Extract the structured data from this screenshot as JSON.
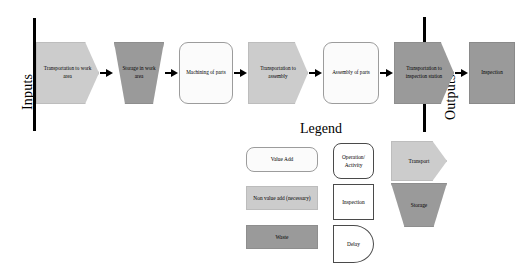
{
  "boundaries": {
    "input_label": "Inputs",
    "output_label": "Outputs"
  },
  "flow": {
    "nodes": [
      {
        "label": "Transportation to work area",
        "shape": "transport",
        "category": "non-value-add"
      },
      {
        "label": "Storage in work area",
        "shape": "storage",
        "category": "waste"
      },
      {
        "label": "Machining of parts",
        "shape": "operation",
        "category": "value-add"
      },
      {
        "label": "Transportation to assembly",
        "shape": "transport",
        "category": "non-value-add"
      },
      {
        "label": "Assembly of parts",
        "shape": "operation",
        "category": "value-add"
      },
      {
        "label": "Transportation to inspection station",
        "shape": "transport",
        "category": "waste"
      },
      {
        "label": "Inspection",
        "shape": "inspection",
        "category": "waste"
      }
    ]
  },
  "legend": {
    "title": "Legend",
    "categories": [
      {
        "label": "Value Add",
        "color": "#fbfbfb"
      },
      {
        "label": "Non value add (necessary)",
        "color": "#cccccc"
      },
      {
        "label": "Waste",
        "color": "#9a9a9a"
      }
    ],
    "shapes": [
      {
        "label": "Operation/ Activity",
        "shape": "rounded-rect"
      },
      {
        "label": "Inspection",
        "shape": "square"
      },
      {
        "label": "Delay",
        "shape": "d-shape"
      },
      {
        "label": "Transport",
        "shape": "pentagon-arrow",
        "color": "#cccccc"
      },
      {
        "label": "Storage",
        "shape": "inverted-trapezoid",
        "color": "#9a9a9a"
      }
    ]
  },
  "colors": {
    "value_add": "#fbfbfb",
    "non_value_add": "#cccccc",
    "waste": "#9a9a9a",
    "outline": "#9c9c9c",
    "boundary": "#000000"
  }
}
